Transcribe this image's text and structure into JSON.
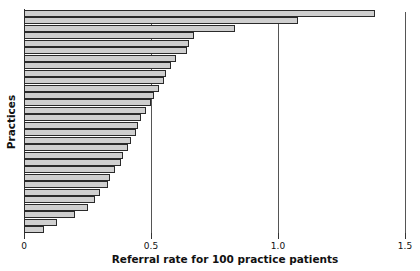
{
  "chart_data": {
    "type": "bar",
    "orientation": "horizontal",
    "title": "",
    "xlabel": "Referral rate for 100 practice patients",
    "ylabel": "Practices",
    "xlim": [
      0,
      1.5
    ],
    "xticks": [
      "0",
      "0.5",
      "1.0",
      "1.5"
    ],
    "xtick_values": [
      0,
      0.5,
      1.0,
      1.5
    ],
    "gridlines_x": [
      0.5,
      1.0,
      1.5
    ],
    "legend": null,
    "bar_color": "#cfcfcf",
    "bar_edge_color": "#2a2a2a",
    "categories": [
      "P1",
      "P2",
      "P3",
      "P4",
      "P5",
      "P6",
      "P7",
      "P8",
      "P9",
      "P10",
      "P11",
      "P12",
      "P13",
      "P14",
      "P15",
      "P16",
      "P17",
      "P18",
      "P19",
      "P20",
      "P21",
      "P22",
      "P23",
      "P24",
      "P25",
      "P26",
      "P27",
      "P28",
      "P29",
      "P30"
    ],
    "values": [
      1.38,
      1.08,
      0.83,
      0.67,
      0.65,
      0.64,
      0.6,
      0.58,
      0.56,
      0.55,
      0.53,
      0.51,
      0.5,
      0.48,
      0.46,
      0.45,
      0.44,
      0.42,
      0.41,
      0.39,
      0.38,
      0.36,
      0.34,
      0.33,
      0.3,
      0.28,
      0.25,
      0.2,
      0.13,
      0.08
    ]
  }
}
